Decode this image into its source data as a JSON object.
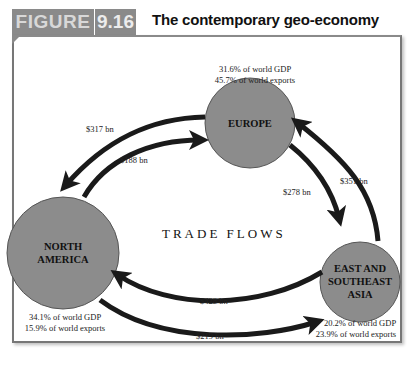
{
  "header": {
    "figure_label": "FIGURE",
    "figure_number": "9.16",
    "title": "The contemporary geo-economy"
  },
  "diagram": {
    "center_label": "TRADE FLOWS",
    "regions": [
      {
        "id": "europe",
        "name": "EUROPE",
        "gdp": "31.6% of world GDP",
        "exports": "45.7% of world exports"
      },
      {
        "id": "north_america",
        "name_line1": "NORTH",
        "name_line2": "AMERICA",
        "gdp": "34.1% of world GDP",
        "exports": "15.9% of world exports"
      },
      {
        "id": "east_asia",
        "name_line1": "EAST AND",
        "name_line2": "SOUTHEAST",
        "name_line3": "ASIA",
        "gdp": "20.2% of world GDP",
        "exports": "23.9% of world exports"
      }
    ],
    "flows": [
      {
        "from": "Europe",
        "to": "North America",
        "value": "$317 bn"
      },
      {
        "from": "North America",
        "to": "Europe",
        "value": "$188 bn"
      },
      {
        "from": "Europe",
        "to": "East and Southeast Asia",
        "value": "$278 bn"
      },
      {
        "from": "East and Southeast Asia",
        "to": "Europe",
        "value": "$351 bn"
      },
      {
        "from": "East and Southeast Asia",
        "to": "North America",
        "value": "$428 bn"
      },
      {
        "from": "North America",
        "to": "East and Southeast Asia",
        "value": "$219 bn"
      }
    ],
    "colors": {
      "circle_fill": "#8c8c8c",
      "circle_stroke": "#555555",
      "arrow": "#1a1a1a",
      "header_bg": "#8a8a8a"
    }
  }
}
